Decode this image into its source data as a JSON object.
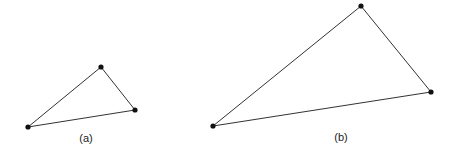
{
  "figure": {
    "triangles": [
      {
        "label": "(a)",
        "vertices": [
          [
            28,
            127
          ],
          [
            101,
            67
          ],
          [
            135,
            110
          ]
        ],
        "label_pos": [
          86,
          138
        ]
      },
      {
        "label": "(b)",
        "vertices": [
          [
            213,
            126
          ],
          [
            361,
            6
          ],
          [
            431,
            92
          ]
        ],
        "label_pos": [
          341,
          137
        ]
      }
    ],
    "line_color": "#333333",
    "point_color": "#111111"
  }
}
